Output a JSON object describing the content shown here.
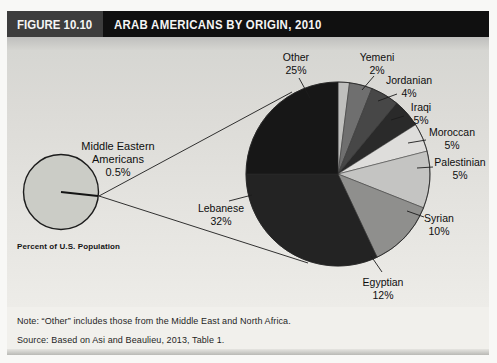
{
  "figure": {
    "number": "FIGURE 10.10",
    "title": "ARAB AMERICANS BY ORIGIN, 2010"
  },
  "population_circle": {
    "label": "Middle Eastern Americans",
    "value": "0.5%",
    "caption": "Percent of U.S. Population",
    "fill": "#cbccc6"
  },
  "chart_data": {
    "type": "pie",
    "title": "Arab Americans by Origin, 2010",
    "unit": "percent",
    "start_angle_deg": 0,
    "direction": "clockwise",
    "slices": [
      {
        "name": "Yemeni",
        "value": 2,
        "pct_label": "2%",
        "color": "#bfbfbd"
      },
      {
        "name": "Jordanian",
        "value": 4,
        "pct_label": "4%",
        "color": "#6f6f6f"
      },
      {
        "name": "Iraqi",
        "value": 5,
        "pct_label": "5%",
        "color": "#474747"
      },
      {
        "name": "Moroccan",
        "value": 5,
        "pct_label": "5%",
        "color": "#2a2a2a"
      },
      {
        "name": "Palestinian",
        "value": 5,
        "pct_label": "5%",
        "color": "#dedddb"
      },
      {
        "name": "Syrian",
        "value": 10,
        "pct_label": "10%",
        "color": "#c4c4c2"
      },
      {
        "name": "Egyptian",
        "value": 12,
        "pct_label": "12%",
        "color": "#8f8f8d"
      },
      {
        "name": "Lebanese",
        "value": 32,
        "pct_label": "32%",
        "color": "#232323"
      },
      {
        "name": "Other",
        "value": 25,
        "pct_label": "25%",
        "color": "#171717"
      }
    ],
    "annotation": "Middle Eastern Americans are 0.5% of the U.S. population"
  },
  "notes": {
    "note": "Note: “Other” includes those from the Middle East and North Africa.",
    "source": "Source: Based on Asi and Beaulieu, 2013, Table 1."
  }
}
